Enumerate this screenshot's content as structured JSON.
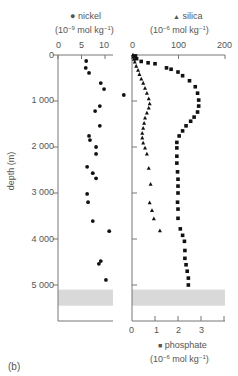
{
  "figure_label": "(b)",
  "chart_data": [
    {
      "type": "scatter",
      "title": "nickel",
      "legend_marker": "circle",
      "xlabel": "nickel (10^-9 mol kg^-1)",
      "ylabel": "depth (m)",
      "x_ticks": [
        0,
        5,
        10
      ],
      "xlim": [
        0,
        12
      ],
      "y_ticks": [
        0,
        1000,
        2000,
        3000,
        4000,
        5000
      ],
      "ylim": [
        0,
        5800
      ],
      "y_inverted": true,
      "points": [
        {
          "x": 6.0,
          "depth": 130
        },
        {
          "x": 5.9,
          "depth": 280
        },
        {
          "x": 6.6,
          "depth": 390
        },
        {
          "x": 9.1,
          "depth": 610
        },
        {
          "x": 9.8,
          "depth": 740
        },
        {
          "x": 14.0,
          "depth": 870
        },
        {
          "x": 8.9,
          "depth": 1110
        },
        {
          "x": 7.9,
          "depth": 1220
        },
        {
          "x": 8.9,
          "depth": 1540
        },
        {
          "x": 6.6,
          "depth": 1760
        },
        {
          "x": 6.8,
          "depth": 1850
        },
        {
          "x": 8.1,
          "depth": 2000
        },
        {
          "x": 8.1,
          "depth": 2150
        },
        {
          "x": 6.2,
          "depth": 2430
        },
        {
          "x": 7.4,
          "depth": 2570
        },
        {
          "x": 8.1,
          "depth": 2680
        },
        {
          "x": 6.2,
          "depth": 3020
        },
        {
          "x": 6.4,
          "depth": 3200
        },
        {
          "x": 7.4,
          "depth": 3610
        },
        {
          "x": 10.9,
          "depth": 3830
        },
        {
          "x": 9.1,
          "depth": 4480
        },
        {
          "x": 8.7,
          "depth": 4540
        },
        {
          "x": 10.2,
          "depth": 4890
        }
      ],
      "shaded_band_depth": [
        5100,
        5450
      ]
    },
    {
      "type": "scatter",
      "title": "silica",
      "legend_marker": "triangle",
      "xlabel": "silica (10^-6 mol kg^-1)",
      "x_axis_position": "top",
      "x_ticks": [
        0,
        100,
        200
      ],
      "xlim": [
        0,
        200
      ],
      "y_inverted": true,
      "points": [
        {
          "x": 2,
          "depth": 0
        },
        {
          "x": 3,
          "depth": 40
        },
        {
          "x": 4,
          "depth": 90
        },
        {
          "x": 6,
          "depth": 150
        },
        {
          "x": 9,
          "depth": 240
        },
        {
          "x": 13,
          "depth": 330
        },
        {
          "x": 16,
          "depth": 420
        },
        {
          "x": 20,
          "depth": 520
        },
        {
          "x": 24,
          "depth": 610
        },
        {
          "x": 28,
          "depth": 720
        },
        {
          "x": 32,
          "depth": 830
        },
        {
          "x": 36,
          "depth": 950
        },
        {
          "x": 38,
          "depth": 1060
        },
        {
          "x": 36,
          "depth": 1150
        },
        {
          "x": 32,
          "depth": 1260
        },
        {
          "x": 28,
          "depth": 1370
        },
        {
          "x": 26,
          "depth": 1480
        },
        {
          "x": 24,
          "depth": 1590
        },
        {
          "x": 22,
          "depth": 1700
        },
        {
          "x": 22,
          "depth": 1800
        },
        {
          "x": 24,
          "depth": 1910
        },
        {
          "x": 28,
          "depth": 2020
        },
        {
          "x": 32,
          "depth": 2150
        },
        {
          "x": 36,
          "depth": 2460
        },
        {
          "x": 40,
          "depth": 2810
        },
        {
          "x": 38,
          "depth": 3210
        },
        {
          "x": 43,
          "depth": 3380
        },
        {
          "x": 47,
          "depth": 3560
        },
        {
          "x": 60,
          "depth": 3820
        }
      ]
    },
    {
      "type": "scatter",
      "title": "phosphate",
      "legend_marker": "square",
      "xlabel": "phosphate (10^-6 mol kg^-1)",
      "x_axis_position": "bottom",
      "x_ticks": [
        0,
        1,
        2,
        3
      ],
      "xlim": [
        0,
        4
      ],
      "y_inverted": true,
      "points": [
        {
          "x": 0.15,
          "depth": 20
        },
        {
          "x": 0.2,
          "depth": 80
        },
        {
          "x": 0.4,
          "depth": 140
        },
        {
          "x": 0.7,
          "depth": 170
        },
        {
          "x": 1.0,
          "depth": 190
        },
        {
          "x": 1.5,
          "depth": 280
        },
        {
          "x": 1.7,
          "depth": 310
        },
        {
          "x": 2.0,
          "depth": 370
        },
        {
          "x": 2.2,
          "depth": 450
        },
        {
          "x": 2.5,
          "depth": 560
        },
        {
          "x": 2.75,
          "depth": 690
        },
        {
          "x": 2.85,
          "depth": 830
        },
        {
          "x": 2.9,
          "depth": 980
        },
        {
          "x": 2.9,
          "depth": 1110
        },
        {
          "x": 2.85,
          "depth": 1240
        },
        {
          "x": 2.7,
          "depth": 1350
        },
        {
          "x": 2.55,
          "depth": 1440
        },
        {
          "x": 2.35,
          "depth": 1540
        },
        {
          "x": 2.2,
          "depth": 1650
        },
        {
          "x": 2.05,
          "depth": 1760
        },
        {
          "x": 1.95,
          "depth": 1900
        },
        {
          "x": 1.95,
          "depth": 2020
        },
        {
          "x": 1.95,
          "depth": 2200
        },
        {
          "x": 1.95,
          "depth": 2350
        },
        {
          "x": 1.98,
          "depth": 2540
        },
        {
          "x": 2.0,
          "depth": 2700
        },
        {
          "x": 2.0,
          "depth": 2850
        },
        {
          "x": 2.0,
          "depth": 3000
        },
        {
          "x": 1.98,
          "depth": 3200
        },
        {
          "x": 2.0,
          "depth": 3350
        },
        {
          "x": 2.0,
          "depth": 3550
        },
        {
          "x": 2.1,
          "depth": 3780
        },
        {
          "x": 2.2,
          "depth": 3920
        },
        {
          "x": 2.28,
          "depth": 4050
        },
        {
          "x": 2.3,
          "depth": 4250
        },
        {
          "x": 2.3,
          "depth": 4420
        },
        {
          "x": 2.35,
          "depth": 4560
        },
        {
          "x": 2.4,
          "depth": 4700
        },
        {
          "x": 2.45,
          "depth": 4850
        },
        {
          "x": 2.45,
          "depth": 5000
        }
      ],
      "shaded_band_depth": [
        5100,
        5450
      ]
    }
  ],
  "labels": {
    "nickel_name": "nickel",
    "nickel_unit_pre": "(10",
    "nickel_unit_exp": "−9",
    "nickel_unit_mid": " mol kg",
    "nickel_unit_exp2": "−1",
    "nickel_unit_post": ")",
    "silica_name": "silica",
    "silica_unit_pre": "(10",
    "silica_unit_exp": "−6",
    "silica_unit_mid": " mol kg",
    "silica_unit_exp2": "−1",
    "silica_unit_post": ")",
    "phosphate_name": "phosphate",
    "phosphate_unit_pre": "(10",
    "phosphate_unit_exp": "−6",
    "phosphate_unit_mid": " mol kg",
    "phosphate_unit_exp2": "−1",
    "phosphate_unit_post": ")",
    "depth_axis": "depth (m)",
    "depth_ticks": [
      "0",
      "1 000",
      "2 000",
      "3 000",
      "4 000",
      "5 000"
    ],
    "nickel_ticks": [
      "0",
      "5",
      "10"
    ],
    "silica_ticks": [
      "0",
      "100",
      "200"
    ],
    "phosphate_ticks": [
      "0",
      "1",
      "2",
      "3"
    ]
  },
  "colors": {
    "marker": "#111111",
    "axis": "#777777",
    "band": "#d9d9d9"
  }
}
